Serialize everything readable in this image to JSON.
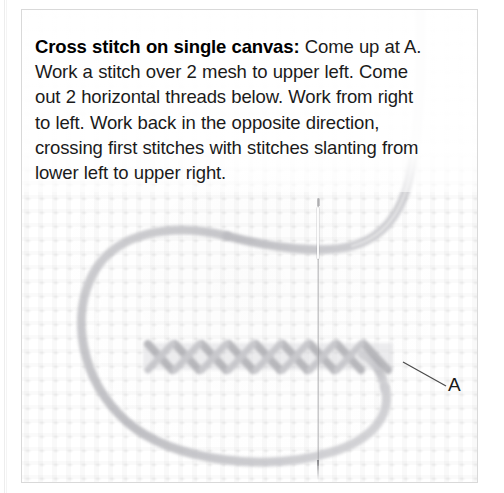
{
  "figure": {
    "kind": "needlework-instruction-illustration",
    "caption": {
      "lead": "Cross stitch on single canvas:",
      "body": " Come up at A. Work a stitch over 2 mesh to upper left. Come out 2 horizontal threads below. Work from right to left. Work back in the opposite direction, crossing first stitches with stitches slanting from lower left to upper right."
    },
    "callouts": [
      {
        "id": "A",
        "label": "A"
      }
    ],
    "elements": {
      "needle_name": "sewing-needle",
      "thread_name": "embroidery-floss",
      "canvas_name": "single-mesh-canvas",
      "stitch_row_name": "row-of-half-cross-stitches"
    },
    "colors": {
      "paper": "#ffffff",
      "frame_border": "#d9d9d9",
      "text": "#1b1b1b",
      "thread": "#b9b9bd",
      "needle": "#8c8c90",
      "mesh": "#efefef",
      "leader_line": "#4a4a4a"
    }
  }
}
